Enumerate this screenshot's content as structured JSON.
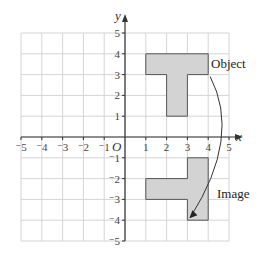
{
  "diagram": {
    "type": "coordinate-grid-rotation",
    "x_axis": {
      "label": "x",
      "min": -5,
      "max": 5,
      "ticks": [
        "-5",
        "-4",
        "-3",
        "-2",
        "-1",
        "1",
        "2",
        "3",
        "4",
        "5"
      ]
    },
    "y_axis": {
      "label": "y",
      "min": -5,
      "max": 5,
      "ticks": [
        "5",
        "4",
        "3",
        "2",
        "1",
        "-1",
        "-2",
        "-3",
        "-4",
        "-5"
      ]
    },
    "origin_label": "O",
    "object": {
      "label": "Object",
      "vertices": [
        [
          1,
          4
        ],
        [
          4,
          4
        ],
        [
          4,
          3
        ],
        [
          3,
          3
        ],
        [
          3,
          1
        ],
        [
          2,
          1
        ],
        [
          2,
          3
        ],
        [
          1,
          3
        ]
      ]
    },
    "image": {
      "label": "Image",
      "vertices": [
        [
          4,
          -1
        ],
        [
          4,
          -4
        ],
        [
          3,
          -4
        ],
        [
          3,
          -3
        ],
        [
          1,
          -3
        ],
        [
          1,
          -2
        ],
        [
          3,
          -2
        ],
        [
          3,
          -1
        ]
      ]
    },
    "arrow": {
      "from": [
        4,
        3
      ],
      "to": [
        3,
        -4
      ],
      "description": "clockwise rotation arrow from Object to Image"
    },
    "colors": {
      "grid": "#d4d4d4",
      "axis": "#333333",
      "shape_fill": "#d3d3d3",
      "shape_stroke": "#555555"
    }
  }
}
